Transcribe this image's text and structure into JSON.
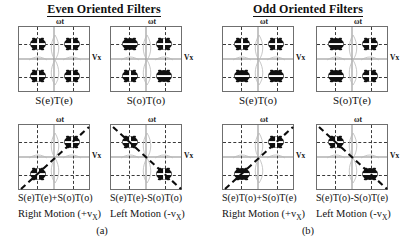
{
  "figure": {
    "columns": [
      {
        "id": "even",
        "title": "Even Oriented Filters",
        "subfigure_label": "(a)"
      },
      {
        "id": "odd",
        "title": "Odd Oriented Filters",
        "subfigure_label": "(b)"
      }
    ],
    "axis_labels": {
      "vertical": "ωt",
      "horizontal": "Vx"
    }
  },
  "panels": [
    {
      "key": "even-top-left",
      "equation": "S(e)T(e)",
      "motion": "",
      "vertical_axis": "ωt",
      "horizontal_axis": "Vx",
      "lobe_sign_by_quadrant": {
        "q1": "+",
        "q2": "+",
        "q3": "+",
        "q4": "+"
      },
      "diagonal": "none"
    },
    {
      "key": "even-top-right",
      "equation": "S(o)T(o)",
      "motion": "",
      "vertical_axis": "ωt",
      "horizontal_axis": "Vx",
      "lobe_sign_by_quadrant": {
        "q1": "+",
        "q2": "-",
        "q3": "+",
        "q4": "-"
      },
      "diagonal": "none"
    },
    {
      "key": "even-bottom-left",
      "equation": "S(e)T(e)+S(o)T(o)",
      "motion": "Right Motion (+v",
      "motion_sub": "X",
      "motion_tail": ")",
      "vertical_axis": "ωt",
      "horizontal_axis": "Vx",
      "lobe_sign_by_quadrant": {
        "q1": "+",
        "q2": "none",
        "q3": "+",
        "q4": "none"
      },
      "diagonal": "ascending"
    },
    {
      "key": "even-bottom-right",
      "equation": "S(e)T(e)-S(o)T(o)",
      "motion": "Left Motion (-v",
      "motion_sub": "X",
      "motion_tail": ")",
      "vertical_axis": "ωt",
      "horizontal_axis": "Vx",
      "lobe_sign_by_quadrant": {
        "q1": "none",
        "q2": "+",
        "q3": "none",
        "q4": "+"
      },
      "diagonal": "descending"
    },
    {
      "key": "odd-top-left",
      "equation": "S(e)T(o)",
      "motion": "",
      "vertical_axis": "ωt",
      "horizontal_axis": "Vx",
      "lobe_sign_by_quadrant": {
        "q1": "+",
        "q2": "+",
        "q3": "-",
        "q4": "-"
      },
      "diagonal": "none"
    },
    {
      "key": "odd-top-right",
      "equation": "S(o)T(e)",
      "motion": "",
      "vertical_axis": "ωt",
      "horizontal_axis": "Vx",
      "lobe_sign_by_quadrant": {
        "q1": "+",
        "q2": "-",
        "q3": "-",
        "q4": "+"
      },
      "diagonal": "none"
    },
    {
      "key": "odd-bottom-left",
      "equation": "S(e)T(o)+S(o)T(e)",
      "motion": "Right Motion (+v",
      "motion_sub": "X",
      "motion_tail": ")",
      "vertical_axis": "ωt",
      "horizontal_axis": "Vx",
      "lobe_sign_by_quadrant": {
        "q1": "+",
        "q2": "none",
        "q3": "-",
        "q4": "none"
      },
      "diagonal": "ascending"
    },
    {
      "key": "odd-bottom-right",
      "equation": "S(e)T(o)-S(o)T(e)",
      "motion": "Left Motion (-v",
      "motion_sub": "X",
      "motion_tail": ")",
      "vertical_axis": "ωt",
      "horizontal_axis": "Vx",
      "lobe_sign_by_quadrant": {
        "q1": "none",
        "q2": "+",
        "q3": "none",
        "q4": "-"
      },
      "diagonal": "descending"
    }
  ],
  "chart_data": {
    "type": "heatmap",
    "xlabel": "Vx",
    "ylabel": "ωt",
    "grid": true,
    "legend": "none",
    "panels": [
      {
        "name": "S(e)T(e)",
        "lobes": [
          [
            1,
            1,
            "+"
          ],
          [
            -1,
            1,
            "+"
          ],
          [
            -1,
            -1,
            "+"
          ],
          [
            1,
            -1,
            "+"
          ]
        ],
        "diagonal": null
      },
      {
        "name": "S(o)T(o)",
        "lobes": [
          [
            1,
            1,
            "+"
          ],
          [
            -1,
            1,
            "-"
          ],
          [
            -1,
            -1,
            "+"
          ],
          [
            1,
            -1,
            "-"
          ]
        ],
        "diagonal": null
      },
      {
        "name": "S(e)T(e)+S(o)T(o)",
        "lobes": [
          [
            1,
            1,
            "+"
          ],
          [
            -1,
            -1,
            "+"
          ]
        ],
        "diagonal": "ascending"
      },
      {
        "name": "S(e)T(e)-S(o)T(o)",
        "lobes": [
          [
            -1,
            1,
            "+"
          ],
          [
            1,
            -1,
            "+"
          ]
        ],
        "diagonal": "descending"
      },
      {
        "name": "S(e)T(o)",
        "lobes": [
          [
            1,
            1,
            "+"
          ],
          [
            -1,
            1,
            "+"
          ],
          [
            -1,
            -1,
            "-"
          ],
          [
            1,
            -1,
            "-"
          ]
        ],
        "diagonal": null
      },
      {
        "name": "S(o)T(e)",
        "lobes": [
          [
            1,
            1,
            "+"
          ],
          [
            -1,
            1,
            "-"
          ],
          [
            -1,
            -1,
            "-"
          ],
          [
            1,
            -1,
            "+"
          ]
        ],
        "diagonal": null
      },
      {
        "name": "S(e)T(o)+S(o)T(e)",
        "lobes": [
          [
            1,
            1,
            "+"
          ],
          [
            -1,
            -1,
            "-"
          ]
        ],
        "diagonal": "ascending"
      },
      {
        "name": "S(e)T(o)-S(o)T(e)",
        "lobes": [
          [
            -1,
            1,
            "+"
          ],
          [
            1,
            -1,
            "-"
          ]
        ],
        "diagonal": "descending"
      }
    ]
  }
}
